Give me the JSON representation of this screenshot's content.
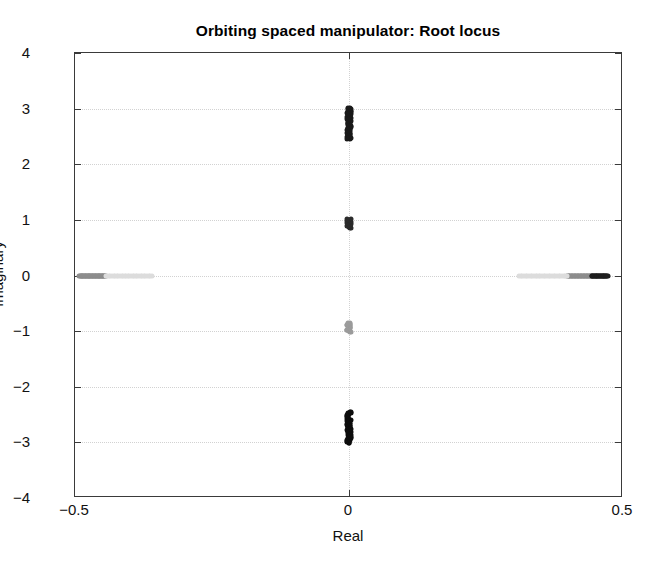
{
  "chart_data": {
    "type": "scatter",
    "title": "Orbiting spaced manipulator: Root locus",
    "xlabel": "Real",
    "ylabel": "Imaginary",
    "xlim": [
      -0.5,
      0.5
    ],
    "ylim": [
      -4,
      4
    ],
    "grid": true,
    "legend": null,
    "xticks": [
      -0.5,
      0,
      0.5
    ],
    "xtick_labels": [
      "−0.5",
      "0",
      "0.5"
    ],
    "yticks": [
      -4,
      -3,
      -2,
      -1,
      0,
      1,
      2,
      3,
      4
    ],
    "ytick_labels": [
      "−4",
      "−3",
      "−2",
      "−1",
      "0",
      "1",
      "2",
      "3",
      "4"
    ],
    "marker": "dot",
    "marker_size": 3,
    "branches": [
      {
        "name": "upper-imaginary-branch",
        "description": "Dense near-vertical cluster of closed-loop poles on the imaginary axis between +2.45 and +3.0",
        "color": "#1a1a1a",
        "real_range": [
          -0.004,
          0.004
        ],
        "imag_range": [
          2.45,
          3.02
        ],
        "point_count": 60
      },
      {
        "name": "upper-inner-branch",
        "description": "Short dark cluster on the imaginary axis between +0.85 and +1.0",
        "color": "#2b2b2b",
        "real_range": [
          -0.004,
          0.004
        ],
        "imag_range": [
          0.85,
          1.02
        ],
        "point_count": 22
      },
      {
        "name": "lower-inner-branch",
        "description": "Short light-gray cluster on the imaginary axis between -1.0 and -0.85",
        "color": "#9b9b9b",
        "real_range": [
          -0.004,
          0.004
        ],
        "imag_range": [
          -1.02,
          -0.85
        ],
        "point_count": 22
      },
      {
        "name": "lower-imaginary-branch",
        "description": "Dense near-vertical cluster of closed-loop poles on the imaginary axis between -3.0 and -2.45",
        "color": "#0d0d0d",
        "real_range": [
          -0.004,
          0.004
        ],
        "imag_range": [
          -3.02,
          -2.45
        ],
        "point_count": 60
      },
      {
        "name": "left-real-branch",
        "description": "Horizontal gray cluster of real poles near the left edge, Real from -0.49 to -0.445 at Imaginary 0",
        "color": "#8d8d8d",
        "real_range": [
          -0.492,
          -0.444
        ],
        "imag_range": [
          0,
          0
        ],
        "point_count": 46
      },
      {
        "name": "left-real-tail",
        "description": "Faint dotted tail of the left real branch extending toward the origin",
        "color": "#dcdcdc",
        "real_range": [
          -0.444,
          -0.36
        ],
        "imag_range": [
          0,
          0
        ],
        "point_count": 30
      },
      {
        "name": "right-real-branch-gray",
        "description": "Horizontal gray cluster of real poles on the right, Real from 0.40 to 0.44 at Imaginary 0",
        "color": "#8d8d8d",
        "real_range": [
          0.398,
          0.443
        ],
        "imag_range": [
          0,
          0
        ],
        "point_count": 34
      },
      {
        "name": "right-real-branch-dark",
        "description": "Dark segment of the right real branch, Real from 0.44 to 0.47 at Imaginary 0",
        "color": "#1f1f1f",
        "real_range": [
          0.443,
          0.472
        ],
        "imag_range": [
          0,
          0
        ],
        "point_count": 26
      },
      {
        "name": "right-real-tail",
        "description": "Faint dotted tail of the right real branch extending toward the origin",
        "color": "#dcdcdc",
        "real_range": [
          0.31,
          0.398
        ],
        "imag_range": [
          0,
          0
        ],
        "point_count": 30
      }
    ]
  },
  "colors": {
    "axis": "#3a3a3a",
    "grid": "#d2d2d2",
    "background": "#ffffff",
    "text": "#111111"
  }
}
